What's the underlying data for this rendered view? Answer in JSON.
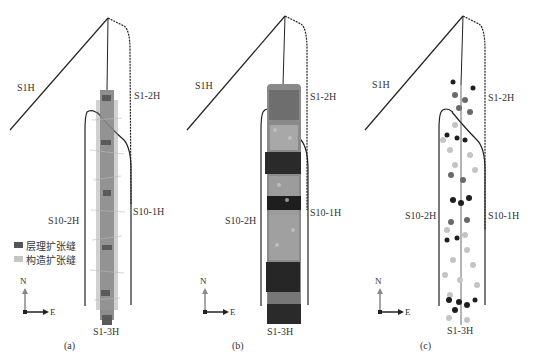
{
  "panels": [
    {
      "id": "a",
      "label": "(a)",
      "fracture_style": "fiber-strands",
      "wells": {
        "s1h": "S1H",
        "s1_2h": "S1-2H",
        "s10_2h": "S10-2H",
        "s10_1h": "S10-1H",
        "s1_3h": "S1-3H"
      },
      "compass": {
        "n": "N",
        "e": "E"
      }
    },
    {
      "id": "b",
      "label": "(b)",
      "fracture_style": "dense-cluster",
      "wells": {
        "s1h": "S1H",
        "s1_2h": "S1-2H",
        "s10_2h": "S10-2H",
        "s10_1h": "S10-1H",
        "s1_3h": "S1-3H"
      },
      "compass": {
        "n": "N",
        "e": "E"
      }
    },
    {
      "id": "c",
      "label": "(c)",
      "fracture_style": "scatter-points",
      "wells": {
        "s1h": "S1H",
        "s1_2h": "S1-2H",
        "s10_2h": "S10-2H",
        "s10_1h": "S10-1H",
        "s1_3h": "S1-3H"
      },
      "compass": {
        "n": "N",
        "e": "E"
      }
    }
  ],
  "legend": {
    "items": [
      {
        "label": "层理扩张缝",
        "color": "#555555"
      },
      {
        "label": "构造扩张缝",
        "color": "#c4c4c4"
      }
    ]
  },
  "colors": {
    "well_line": "#222222",
    "bedding_fracture": "#555555",
    "structural_fracture": "#c4c4c4",
    "dense_dark": "#1e1e1e"
  }
}
